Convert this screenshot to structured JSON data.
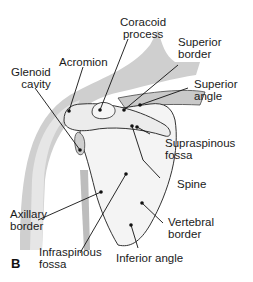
{
  "figure": {
    "panel_letter": "B"
  },
  "labels": {
    "coracoid_process": [
      "Coracoid",
      "process"
    ],
    "acromion": [
      "Acromion"
    ],
    "glenoid_cavity": [
      "Glenoid",
      "cavity"
    ],
    "superior_border": [
      "Superior",
      "border"
    ],
    "superior_angle": [
      "Superior",
      "angle"
    ],
    "supraspinous_fossa": [
      "Supraspinous",
      "fossa"
    ],
    "spine": [
      "Spine"
    ],
    "axillary_border": [
      "Axillary",
      "border"
    ],
    "vertebral_border": [
      "Vertebral",
      "border"
    ],
    "infraspinous_fossa": [
      "Infraspinous",
      "fossa"
    ],
    "inferior_angle": [
      "Inferior angle"
    ]
  },
  "colors": {
    "bone_fill": "#f2f2f2",
    "soft_tissue": "#c8c8c8",
    "outline": "#333333",
    "text": "#1a1a1a",
    "background": "#ffffff"
  }
}
